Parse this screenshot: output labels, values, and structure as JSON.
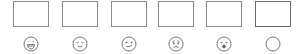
{
  "rating_picker": {
    "options": [
      {
        "id": "laughing",
        "icon": "laughing-face-icon",
        "label": ""
      },
      {
        "id": "content",
        "icon": "content-face-icon",
        "label": ""
      },
      {
        "id": "smirk",
        "icon": "slight-smile-face-icon",
        "label": ""
      },
      {
        "id": "sad",
        "icon": "sad-face-icon",
        "label": ""
      },
      {
        "id": "shocked",
        "icon": "shocked-face-icon",
        "label": ""
      },
      {
        "id": "none",
        "icon": "empty-circle-icon",
        "label": ""
      }
    ],
    "stroke_color": "#777777",
    "box_border_color": "#8a8a8a"
  }
}
